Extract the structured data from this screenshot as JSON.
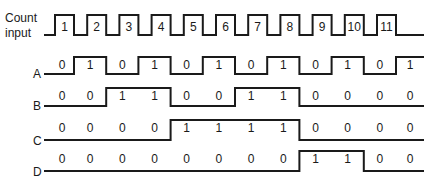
{
  "diagram": {
    "type": "timing-diagram",
    "clock": {
      "label_line1": "Count",
      "label_line2": "input",
      "pulses": [
        "1",
        "2",
        "3",
        "4",
        "5",
        "6",
        "7",
        "8",
        "9",
        "10",
        "11"
      ]
    },
    "signals": [
      {
        "name": "A",
        "values": [
          "0",
          "1",
          "0",
          "1",
          "0",
          "1",
          "0",
          "1",
          "0",
          "1",
          "0",
          "1"
        ]
      },
      {
        "name": "B",
        "values": [
          "0",
          "0",
          "1",
          "1",
          "0",
          "0",
          "1",
          "1",
          "0",
          "0",
          "0",
          "0"
        ]
      },
      {
        "name": "C",
        "values": [
          "0",
          "0",
          "0",
          "0",
          "1",
          "1",
          "1",
          "1",
          "0",
          "0",
          "0",
          "0"
        ]
      },
      {
        "name": "D",
        "values": [
          "0",
          "0",
          "0",
          "0",
          "0",
          "0",
          "0",
          "0",
          "1",
          "1",
          "0",
          "0"
        ]
      }
    ],
    "colors": {
      "line": "#1a1a1a",
      "background": "#ffffff"
    }
  }
}
